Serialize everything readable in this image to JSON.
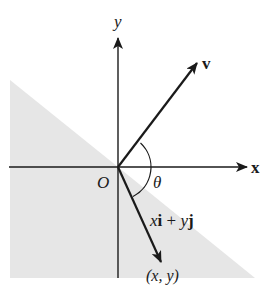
{
  "diagram": {
    "type": "vector-coordinate-plane",
    "colors": {
      "background": "#ffffff",
      "shading": "#e6e6e6",
      "ink": "#1a1a1a"
    },
    "axes": {
      "x_label": "x",
      "y_label": "y",
      "origin_label": "O"
    },
    "vectors": [
      {
        "name": "v",
        "label": "v"
      },
      {
        "name": "position",
        "label_parts": [
          "x",
          "i",
          " + ",
          "y",
          "j"
        ],
        "endpoint_label": "(x, y)"
      }
    ],
    "angle": {
      "label": "θ"
    },
    "shaded_region": "half-plane below the line through O perpendicular to v"
  }
}
